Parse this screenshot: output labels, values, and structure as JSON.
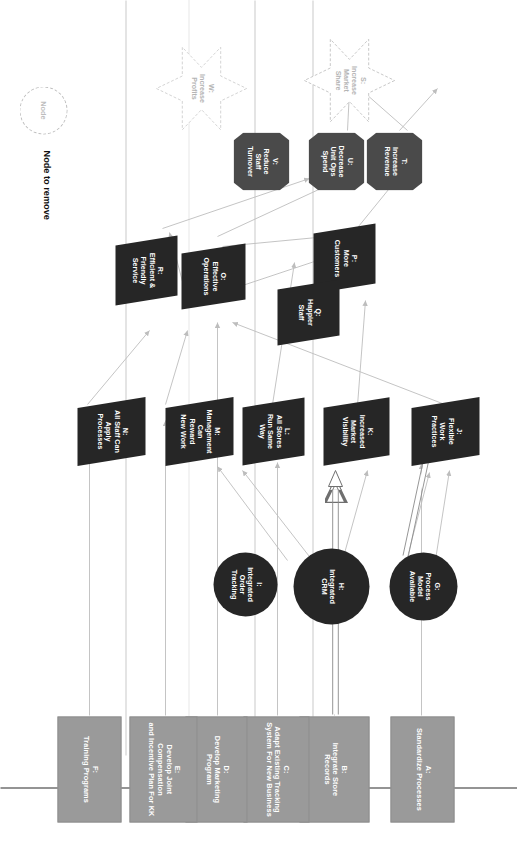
{
  "diagram": {
    "legend": {
      "node_label": "Node",
      "caption": "Node to remove"
    },
    "colors": {
      "enabler_fill": "#9a9a9a",
      "capability_fill": "#262626",
      "change_fill": "#262626",
      "benefit_fill": "#262626",
      "objective_fill": "#4a4a4a",
      "removed_outline": "#c0c0c0",
      "edge": "#bdbdbd",
      "highlight_edge": "#777777",
      "text_light": "#ffffff"
    },
    "columns": [
      {
        "key": "enablers",
        "shape": "rect"
      },
      {
        "key": "capabilities",
        "shape": "circle"
      },
      {
        "key": "changes",
        "shape": "parallelogram"
      },
      {
        "key": "benefits",
        "shape": "parallelogram"
      },
      {
        "key": "objectives",
        "shape": "octagon"
      },
      {
        "key": "drivers",
        "shape": "star"
      }
    ],
    "nodes": [
      {
        "id": "A",
        "shape": "rect",
        "label": "A:\nStandardize Processes"
      },
      {
        "id": "B",
        "shape": "rect",
        "label": "B:\nIntegrate Store\nRecords"
      },
      {
        "id": "C",
        "shape": "rect",
        "label": "C:\nAdapt Existing Tracking\nSystem For New Business"
      },
      {
        "id": "D",
        "shape": "rect",
        "label": "D:\nDevelop Marketing\nProgram"
      },
      {
        "id": "E",
        "shape": "rect",
        "label": "E:\nDevelop Joint Compensation\nand Incentive Plan For KK"
      },
      {
        "id": "F",
        "shape": "rect",
        "label": "F:\nTraining Programs"
      },
      {
        "id": "G",
        "shape": "circle",
        "label": "G:\nProcess\nModel\nAvailable"
      },
      {
        "id": "H",
        "shape": "circle",
        "label": "H:\nIntegrated\nCRM"
      },
      {
        "id": "I",
        "shape": "circle",
        "label": "I:\nIntegrated\nOrder\nTracking"
      },
      {
        "id": "J",
        "shape": "parallelogram",
        "label": "J:\nFlexible\nWork\nPractices"
      },
      {
        "id": "K",
        "shape": "parallelogram",
        "label": "K:\nIncreased\nMarket\nVisibility"
      },
      {
        "id": "L",
        "shape": "parallelogram",
        "label": "L:\nAll Stores\nRun Same\nWay"
      },
      {
        "id": "M",
        "shape": "parallelogram",
        "label": "M:\nManagement\nCan\nReward\nNew Work"
      },
      {
        "id": "N",
        "shape": "parallelogram",
        "label": "N:\nAll Staff Can\nApply\nProcesses"
      },
      {
        "id": "O",
        "shape": "parallelogram",
        "label": "O:\nEffective\nOperations"
      },
      {
        "id": "P",
        "shape": "parallelogram",
        "label": "P:\nMore\nCustomers"
      },
      {
        "id": "Q",
        "shape": "parallelogram",
        "label": "Q:\nHappier\nStaff"
      },
      {
        "id": "R",
        "shape": "parallelogram",
        "label": "R:\nEfficient &\nFriendly\nService"
      },
      {
        "id": "T",
        "shape": "octagon",
        "label": "T:\nIncrease\nRevenue"
      },
      {
        "id": "U",
        "shape": "octagon",
        "label": "U:\nDecrease\nUnit Ops\nSpend"
      },
      {
        "id": "V",
        "shape": "octagon",
        "label": "V:\nReduce\nStaff\nTurnover"
      },
      {
        "id": "S",
        "shape": "star",
        "label": "S:\nIncrease\nMarket\nShare"
      },
      {
        "id": "W",
        "shape": "star",
        "label": "W:\nIncrease\nProfits"
      }
    ],
    "edges": [
      {
        "from": "A",
        "to": "G",
        "style": "thin"
      },
      {
        "from": "B",
        "to": "H",
        "style": "thick"
      },
      {
        "from": "C",
        "to": "I",
        "style": "thin"
      },
      {
        "from": "D",
        "to": "L",
        "style": "thin"
      },
      {
        "from": "E",
        "to": "M",
        "style": "thin"
      },
      {
        "from": "F",
        "to": "N",
        "style": "thin"
      },
      {
        "from": "G",
        "to": "J",
        "style": "thin"
      },
      {
        "from": "G",
        "to": "H",
        "style": "thin"
      },
      {
        "from": "H",
        "to": "K",
        "style": "thick"
      },
      {
        "from": "H",
        "to": "J",
        "style": "thin"
      },
      {
        "from": "I",
        "to": "L",
        "style": "thin"
      },
      {
        "from": "J",
        "to": "Q",
        "style": "thin"
      },
      {
        "from": "K",
        "to": "P",
        "style": "thin"
      },
      {
        "from": "L",
        "to": "O",
        "style": "thin"
      },
      {
        "from": "M",
        "to": "Q",
        "style": "thin"
      },
      {
        "from": "N",
        "to": "R",
        "style": "thin"
      },
      {
        "from": "O",
        "to": "U",
        "style": "thin"
      },
      {
        "from": "O",
        "to": "P",
        "style": "thin"
      },
      {
        "from": "P",
        "to": "T",
        "style": "thin"
      },
      {
        "from": "Q",
        "to": "V",
        "style": "thin"
      },
      {
        "from": "Q",
        "to": "R",
        "style": "thin"
      },
      {
        "from": "R",
        "to": "P",
        "style": "thin"
      },
      {
        "from": "T",
        "to": "S",
        "style": "thin"
      },
      {
        "from": "T",
        "to": "W",
        "style": "thin"
      },
      {
        "from": "U",
        "to": "W",
        "style": "thin"
      },
      {
        "from": "V",
        "to": "U",
        "style": "thin"
      }
    ]
  }
}
